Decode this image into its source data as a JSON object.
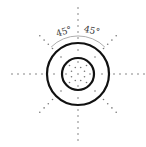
{
  "diagram": {
    "center": [
      78,
      74
    ],
    "outer_circle_radius": 31,
    "inner_circle_radius": 16,
    "inner_dot_ring_radius": 7,
    "inner_dot_count": 8,
    "radial_line_count": 8,
    "radial_angle_step_deg": 45,
    "dot_spacing": 6,
    "radial_start": 12,
    "radial_end": 66,
    "diagonal_end": 56,
    "arc_radius": 38,
    "labels": {
      "angle_left": "45°",
      "angle_right": "45°"
    },
    "colors": {
      "circle": "#111111",
      "dot": "#777777",
      "arc": "#999999",
      "label": "#333333"
    }
  }
}
